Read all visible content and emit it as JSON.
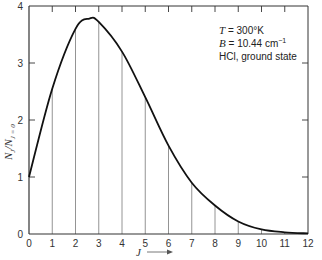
{
  "chart_data": {
    "type": "line",
    "title": "",
    "xlabel": "J →",
    "ylabel": "N_J / N_{J=0}",
    "xlim": [
      0,
      12
    ],
    "ylim": [
      0,
      4
    ],
    "x_ticks": [
      0,
      1,
      2,
      3,
      4,
      5,
      6,
      7,
      8,
      9,
      10,
      11,
      12
    ],
    "y_ticks": [
      0,
      1,
      2,
      3,
      4
    ],
    "grid": false,
    "drop_lines": true,
    "series": [
      {
        "name": "N_J/N_0",
        "x": [
          0,
          1,
          2,
          3,
          4,
          5,
          6,
          7,
          8,
          9,
          10,
          11,
          12
        ],
        "values": [
          1.0,
          2.55,
          3.6,
          3.72,
          3.2,
          2.4,
          1.55,
          0.9,
          0.5,
          0.22,
          0.08,
          0.03,
          0.01
        ]
      }
    ],
    "peak": {
      "x": 2.6,
      "y": 3.78
    },
    "annotations": [
      {
        "label": "T = 300°K"
      },
      {
        "label": "B = 10.44 cm⁻¹"
      },
      {
        "label": "HCl, ground state"
      }
    ]
  },
  "labels": {
    "annotation_T_var": "T",
    "annotation_T_val": " = 300°K",
    "annotation_B_var": "B",
    "annotation_B_val": " = 10.44 cm",
    "annotation_B_exp": "−1",
    "annotation_line3": "HCl, ground state",
    "xlabel": "J",
    "ylabel": "N",
    "ylabel_sub1": "J",
    "ylabel_mid": "/N",
    "ylabel_sub2": "J = 0"
  },
  "colors": {
    "axis": "#333333",
    "curve": "#111111",
    "drop": "#888888"
  }
}
